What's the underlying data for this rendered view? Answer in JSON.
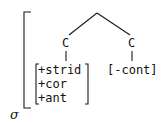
{
  "diagram": {
    "type": "phonological-feature-tree",
    "root_label": "σ",
    "nodes": [
      {
        "id": "left",
        "label": "C",
        "features": [
          "+strid",
          "+cor",
          "+ant"
        ]
      },
      {
        "id": "right",
        "label": "C",
        "features": [
          "-cont"
        ]
      }
    ],
    "right_matrix_text": "[-cont]"
  }
}
